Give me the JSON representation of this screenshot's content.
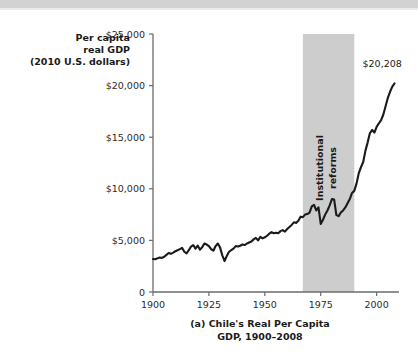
{
  "figure": {
    "background": "#ffffff",
    "top_band_color": "#d2d2d2"
  },
  "chart_data": {
    "type": "line",
    "title": "",
    "caption_line1": "(a) Chile's Real Per Capita",
    "caption_line2": "GDP, 1900–2008",
    "ylabel_line1": "Per capita",
    "ylabel_line2": "real GDP",
    "ylabel_line3": "(2010 U.S. dollars)",
    "xlabel": "",
    "xlim": [
      1900,
      2010
    ],
    "ylim": [
      0,
      25000
    ],
    "grid": false,
    "legend": null,
    "line_color": "#1a1a1a",
    "line_width": 2.1,
    "xticks": [
      1900,
      1925,
      1950,
      1975,
      2000
    ],
    "xticklabels": [
      "1900",
      "1925",
      "1950",
      "1975",
      "2000"
    ],
    "yticks": [
      0,
      5000,
      10000,
      15000,
      20000,
      25000
    ],
    "yticklabels": [
      "0",
      "$5,000",
      "$10,000",
      "$15,000",
      "$20,000",
      "$25,000"
    ],
    "annotations": [
      {
        "name": "institutional-reforms-band",
        "kind": "vspan",
        "label_line1": "Institutional",
        "label_line2": "reforms",
        "x_start": 1967,
        "x_end": 1990,
        "color": "#cdcdcd",
        "label_rotation": -90
      },
      {
        "name": "endpoint-value-label",
        "kind": "point-label",
        "text": "$20,208",
        "x": 2008,
        "y": 20208
      }
    ],
    "series": [
      {
        "name": "Chile real GDP per capita",
        "x": [
          1900,
          1901,
          1902,
          1903,
          1904,
          1905,
          1906,
          1907,
          1908,
          1909,
          1910,
          1911,
          1912,
          1913,
          1914,
          1915,
          1916,
          1917,
          1918,
          1919,
          1920,
          1921,
          1922,
          1923,
          1924,
          1925,
          1926,
          1927,
          1928,
          1929,
          1930,
          1931,
          1932,
          1933,
          1934,
          1935,
          1936,
          1937,
          1938,
          1939,
          1940,
          1941,
          1942,
          1943,
          1944,
          1945,
          1946,
          1947,
          1948,
          1949,
          1950,
          1951,
          1952,
          1953,
          1954,
          1955,
          1956,
          1957,
          1958,
          1959,
          1960,
          1961,
          1962,
          1963,
          1964,
          1965,
          1966,
          1967,
          1968,
          1969,
          1970,
          1971,
          1972,
          1973,
          1974,
          1975,
          1976,
          1977,
          1978,
          1979,
          1980,
          1981,
          1982,
          1983,
          1984,
          1985,
          1986,
          1987,
          1988,
          1989,
          1990,
          1991,
          1992,
          1993,
          1994,
          1995,
          1996,
          1997,
          1998,
          1999,
          2000,
          2001,
          2002,
          2003,
          2004,
          2005,
          2006,
          2007,
          2008
        ],
        "y": [
          3200,
          3180,
          3260,
          3350,
          3300,
          3420,
          3600,
          3780,
          3700,
          3820,
          3950,
          4050,
          4150,
          4280,
          3900,
          3750,
          4050,
          4400,
          4550,
          4200,
          4500,
          4100,
          4350,
          4700,
          4600,
          4450,
          4150,
          4000,
          4450,
          4700,
          4300,
          3550,
          3000,
          3500,
          3900,
          4050,
          4200,
          4450,
          4400,
          4480,
          4600,
          4550,
          4700,
          4800,
          4900,
          5100,
          5250,
          5000,
          5350,
          5200,
          5300,
          5450,
          5650,
          5800,
          5700,
          5750,
          5700,
          5900,
          6000,
          5850,
          6100,
          6300,
          6500,
          6750,
          6700,
          6900,
          7300,
          7250,
          7500,
          7550,
          7700,
          8300,
          8450,
          7900,
          8200,
          6600,
          7000,
          7500,
          7900,
          8400,
          9000,
          8950,
          7450,
          7350,
          7700,
          7900,
          8200,
          8600,
          9000,
          9600,
          9800,
          10500,
          11500,
          12100,
          12600,
          13700,
          14500,
          15400,
          15700,
          15450,
          16000,
          16350,
          16650,
          17200,
          18000,
          18800,
          19400,
          19900,
          20208
        ]
      }
    ],
    "final_value": 20208
  }
}
